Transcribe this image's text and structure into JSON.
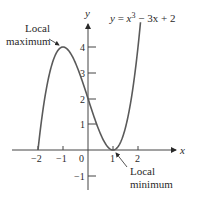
{
  "chart_data": {
    "type": "line",
    "title": "",
    "equation": "y = x³ − 3x + 2",
    "equation_parts": {
      "lhs": "y",
      "eq": " = ",
      "x": "x",
      "exp": "3",
      "rest": " − 3x + 2"
    },
    "xlabel": "x",
    "ylabel": "y",
    "xlim": [
      -2.2,
      3.5
    ],
    "ylim": [
      -1.5,
      5
    ],
    "x_ticks": [
      "−2",
      "−1",
      "0",
      "1",
      "2"
    ],
    "y_ticks": [
      "4",
      "3",
      "2",
      "1",
      "−1"
    ],
    "grid": false,
    "series": [
      {
        "name": "y = x^3 - 3x + 2",
        "color": "#5a5a5a",
        "x": [
          -2,
          -1.5,
          -1,
          -0.5,
          0,
          0.5,
          1,
          1.5,
          2.2
        ],
        "values": [
          0,
          3.125,
          4,
          3.375,
          2,
          0.625,
          0,
          0.875,
          5.048
        ]
      }
    ],
    "annotations": [
      {
        "lines": [
          "Local",
          "maximum"
        ],
        "point": [
          -1,
          4
        ]
      },
      {
        "lines": [
          "Local",
          "minimum"
        ],
        "point": [
          1,
          0
        ]
      }
    ]
  },
  "labels": {
    "annot_max_1": "Local",
    "annot_max_2": "maximum",
    "annot_min_1": "Local",
    "annot_min_2": "minimum"
  }
}
